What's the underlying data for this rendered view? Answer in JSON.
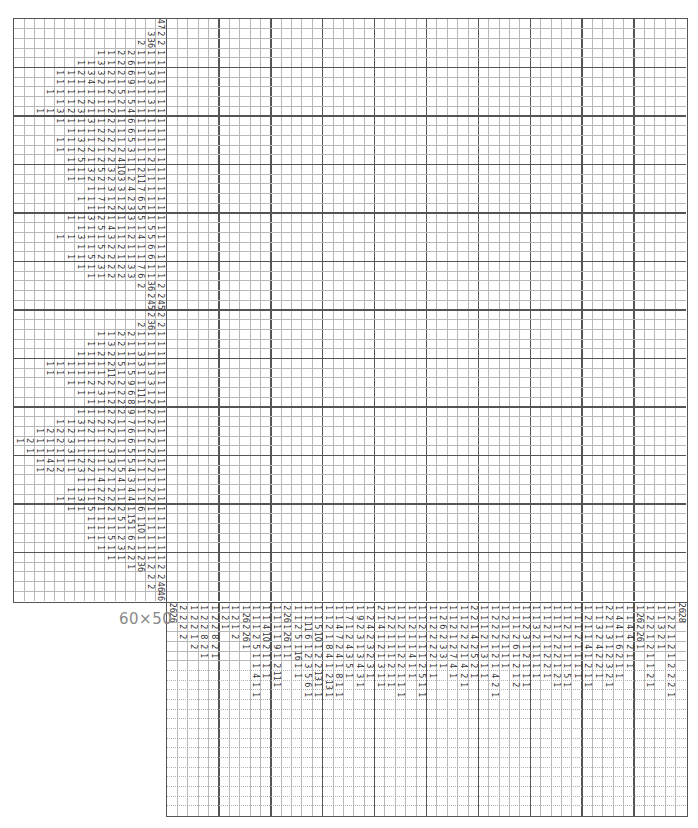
{
  "puzzle": {
    "size_label": "60×50",
    "grid_columns": 50,
    "grid_rows": 60,
    "row_clue_slots": 15,
    "col_clue_slots": 22
  },
  "row_clues": [
    [
      47
    ],
    [
      3,
      2
    ],
    [
      2,
      36,
      2
    ],
    [
      1,
      1,
      2,
      2,
      1,
      1,
      1
    ],
    [
      1,
      1,
      3,
      1,
      2,
      6,
      1,
      1,
      1
    ],
    [
      1,
      1,
      2,
      3,
      3,
      2,
      2,
      6,
      1,
      3,
      1
    ],
    [
      1,
      1,
      1,
      4,
      2,
      1,
      1,
      9,
      1,
      3,
      1
    ],
    [
      1,
      1,
      1,
      1,
      1,
      1,
      2,
      5,
      1,
      1,
      1,
      1
    ],
    [
      1,
      1,
      2,
      2,
      1,
      1,
      2,
      5,
      1,
      3,
      1
    ],
    [
      1,
      1,
      3,
      2,
      3,
      1,
      1,
      2,
      1,
      4,
      1,
      1,
      1
    ],
    [
      1,
      1,
      1,
      3,
      1,
      2,
      1,
      6,
      1,
      1,
      1
    ],
    [
      1,
      1,
      1,
      2,
      2,
      1,
      6,
      1,
      1,
      1
    ],
    [
      1,
      1,
      3,
      1,
      2,
      2,
      1,
      5,
      1,
      1,
      1
    ],
    [
      1,
      1,
      2,
      2,
      1,
      2,
      2,
      3,
      1,
      1,
      1
    ],
    [
      1,
      5,
      1,
      2,
      2,
      4,
      1,
      1,
      2,
      1
    ],
    [
      1,
      1,
      3,
      5,
      3,
      10,
      1,
      2,
      1,
      1
    ],
    [
      1,
      1,
      2,
      2,
      2,
      3,
      2,
      11,
      1,
      1
    ],
    [
      1,
      1,
      3,
      3,
      4,
      7,
      1,
      1
    ],
    [
      1,
      1,
      7,
      1,
      1,
      2,
      6,
      1,
      1
    ],
    [
      1,
      1,
      2,
      2,
      3,
      5,
      1,
      1
    ],
    [
      1,
      1,
      3,
      2,
      1,
      1,
      3,
      5,
      1,
      1
    ],
    [
      1,
      1,
      5,
      4,
      1,
      1,
      1,
      5,
      1
    ],
    [
      1,
      1,
      3,
      1,
      1,
      3,
      1,
      2,
      4,
      5,
      1
    ],
    [
      1,
      1,
      5,
      2,
      2,
      1,
      1,
      6,
      1
    ],
    [
      1,
      1,
      5,
      2,
      2,
      1,
      1,
      1,
      6,
      1
    ],
    [
      1,
      1,
      3,
      2,
      2,
      3,
      7,
      1,
      1
    ],
    [
      1,
      1,
      2,
      2,
      3,
      6,
      1,
      1
    ],
    [
      2,
      36,
      2
    ],
    [
      2,
      2
    ],
    [
      45,
      45
    ],
    [
      2,
      2
    ],
    [
      2,
      36,
      2
    ],
    [
      1,
      1,
      2,
      2,
      1,
      1,
      1
    ],
    [
      1,
      1,
      3,
      2,
      1,
      1,
      1,
      1
    ],
    [
      1,
      1,
      2,
      2,
      1,
      1,
      3,
      1,
      1
    ],
    [
      1,
      1,
      1,
      1,
      1,
      1,
      2,
      5,
      1,
      3,
      1,
      1
    ],
    [
      1,
      1,
      1,
      1,
      1,
      1,
      11,
      1,
      5,
      1,
      3,
      1
    ],
    [
      1,
      1,
      2,
      2,
      2,
      2,
      9,
      1,
      3,
      1
    ],
    [
      1,
      1,
      3,
      1,
      2,
      6,
      11,
      1,
      1
    ],
    [
      1,
      1,
      2,
      2,
      8,
      1,
      2,
      1
    ],
    [
      1,
      1,
      1,
      2,
      2,
      9,
      1,
      2,
      1
    ],
    [
      1,
      1,
      3,
      2,
      2,
      2,
      1,
      7,
      1,
      2,
      1
    ],
    [
      1,
      2,
      2,
      2,
      1,
      2,
      1,
      2,
      1,
      6,
      1,
      2,
      1
    ],
    [
      1,
      2,
      1,
      1,
      2,
      3,
      1,
      1,
      1,
      2,
      1,
      6,
      1,
      2,
      1
    ],
    [
      1,
      1,
      1,
      1,
      3,
      1,
      1,
      1,
      3,
      1,
      5,
      1,
      2,
      1
    ],
    [
      1,
      4,
      1,
      1,
      2,
      2,
      1,
      3,
      1,
      5,
      1,
      2,
      1
    ],
    [
      1,
      2,
      2,
      1,
      3,
      2,
      1,
      2,
      5,
      4,
      1,
      2,
      1
    ],
    [
      1,
      1,
      4,
      1,
      4,
      3,
      1,
      1,
      1
    ],
    [
      1,
      1,
      1,
      2,
      2,
      1,
      4,
      1,
      2,
      1
    ],
    [
      1,
      1,
      3,
      1,
      2,
      2,
      1,
      4,
      1,
      2,
      1
    ],
    [
      1,
      1,
      5,
      1,
      2,
      2,
      1,
      6,
      1,
      1
    ],
    [
      1,
      1,
      1,
      5,
      15,
      1,
      1,
      1
    ],
    [
      1,
      1,
      1,
      1,
      1,
      10,
      1,
      1
    ],
    [
      1,
      1,
      5,
      2,
      6,
      1,
      1,
      1
    ],
    [
      1,
      1,
      3,
      2,
      1,
      1,
      1
    ],
    [
      1,
      1,
      2,
      2,
      1,
      1
    ],
    [
      1,
      36,
      2,
      2
    ],
    [
      2,
      2
    ],
    [
      2,
      46
    ],
    [
      46
    ]
  ],
  "col_clues": [
    [
      26,
      26
    ],
    [
      2,
      2,
      2,
      2
    ],
    [
      1,
      2,
      2,
      1,
      2
    ],
    [
      1,
      2,
      2,
      8,
      2,
      1
    ],
    [
      1,
      2,
      2,
      8,
      2,
      1
    ],
    [
      1,
      2,
      1
    ],
    [
      1,
      2,
      1,
      2
    ],
    [
      1,
      26,
      2,
      26,
      1
    ],
    [
      1,
      1,
      1,
      2,
      5,
      1,
      1,
      4,
      1,
      1
    ],
    [
      1,
      1,
      4,
      10,
      2,
      1,
      1,
      1
    ],
    [
      1,
      1,
      1,
      1,
      9,
      1,
      2,
      11,
      1
    ],
    [
      2,
      26,
      1,
      26,
      1,
      1
    ],
    [
      1,
      1,
      2,
      5,
      1,
      16,
      1,
      1
    ],
    [
      1,
      1,
      11,
      6,
      1,
      2,
      3,
      5,
      6,
      1
    ],
    [
      1,
      1,
      5,
      10,
      1,
      2,
      2,
      13,
      1,
      1
    ],
    [
      1,
      1,
      2,
      1,
      8,
      4,
      1,
      2,
      13,
      1
    ],
    [
      1,
      1,
      4,
      7,
      2,
      4,
      1,
      8,
      1,
      1
    ],
    [
      1,
      7,
      1,
      2,
      4,
      3,
      5,
      1
    ],
    [
      1,
      9,
      2,
      3,
      1,
      3,
      4,
      3,
      1
    ],
    [
      1,
      2,
      4,
      2,
      3,
      2,
      3,
      1
    ],
    [
      2,
      1,
      4,
      1,
      2,
      1,
      3,
      1,
      1
    ],
    [
      1,
      2,
      2,
      1,
      1,
      1,
      2,
      1,
      1
    ],
    [
      1,
      1,
      2,
      1,
      1,
      2,
      2,
      1,
      1,
      1
    ],
    [
      1,
      1,
      2,
      1,
      1,
      4,
      1,
      1
    ],
    [
      1,
      1,
      2,
      1,
      1,
      1,
      2,
      5,
      1,
      1
    ],
    [
      1,
      1,
      2,
      2,
      2,
      2,
      1,
      1
    ],
    [
      1,
      2,
      6,
      2,
      3,
      3,
      1
    ],
    [
      1,
      1,
      2,
      1,
      2,
      7,
      4,
      1
    ],
    [
      1,
      1,
      2,
      2,
      2,
      1,
      4,
      2,
      1
    ],
    [
      2,
      2,
      1,
      4,
      2,
      5,
      2,
      1
    ],
    [
      1,
      1,
      1,
      2,
      1,
      3,
      1,
      1
    ],
    [
      1,
      2,
      2,
      2,
      1,
      2,
      1,
      4,
      2,
      1
    ],
    [
      1,
      2,
      1,
      2,
      1,
      1,
      1
    ],
    [
      1,
      1,
      1,
      2,
      6,
      1,
      2,
      1,
      2
    ],
    [
      1,
      1,
      2,
      3,
      1,
      2,
      1,
      1,
      1
    ],
    [
      1,
      1,
      3,
      2,
      1,
      1,
      1,
      1
    ],
    [
      1,
      1,
      2,
      1,
      1,
      2,
      2,
      1
    ],
    [
      1,
      1,
      1,
      2,
      2,
      2,
      1,
      2,
      1
    ],
    [
      1,
      1,
      2,
      1,
      1,
      1,
      1,
      5,
      1
    ],
    [
      1,
      1,
      1,
      2,
      1,
      1,
      1,
      1
    ],
    [
      1,
      2,
      1,
      1,
      4,
      1,
      2,
      1,
      1
    ],
    [
      1,
      1,
      3,
      2,
      4,
      2,
      2,
      1
    ],
    [
      2,
      2,
      1,
      3,
      1,
      2,
      3,
      2,
      1
    ],
    [
      1,
      4,
      4,
      1,
      6,
      2,
      1,
      1
    ],
    [
      1,
      1,
      4,
      4,
      2,
      1,
      1
    ],
    [
      1,
      26,
      2,
      26,
      1
    ],
    [
      1,
      2,
      2,
      1,
      2,
      1,
      1,
      2,
      1
    ],
    [
      1,
      1,
      3,
      2,
      1
    ],
    [
      1,
      2,
      2,
      1,
      2,
      1,
      2,
      2,
      2,
      1
    ],
    [
      26,
      28
    ]
  ],
  "colors": {
    "grid_line": "#b8b8b8",
    "thick_line": "#555555",
    "clue_text": "#333333",
    "label_text": "#8a8a8a",
    "background": "#ffffff"
  }
}
